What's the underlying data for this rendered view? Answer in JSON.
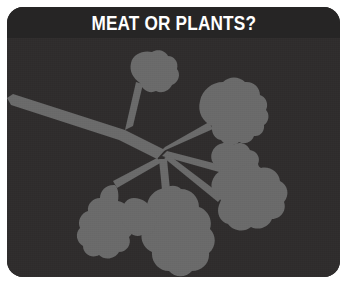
{
  "card": {
    "title": "MEAT OR PLANTS?",
    "background_color": "#2b2a2a",
    "panel_color": "#2f2d2d",
    "title_band_color": "#262525",
    "title_text_color": "#ffffff",
    "frame_color": "#ffffff",
    "corner_radius": "16px"
  },
  "illustration": {
    "name": "plant-branch-silhouette",
    "description": "Gray silhouette of a leafy branch with lobed leaves",
    "silhouette_color": "#6a6a6a",
    "leaf_count": 7
  }
}
